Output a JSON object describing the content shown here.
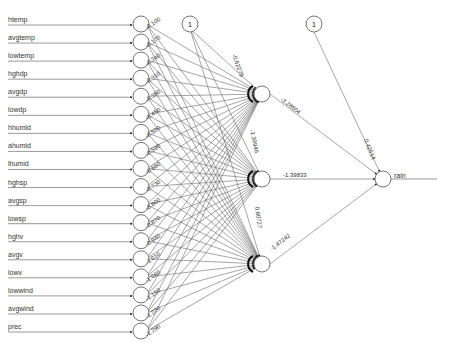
{
  "diagram": {
    "type": "neural-network",
    "inputs": [
      "htemp",
      "avgtemp",
      "lowtemp",
      "hghdp",
      "avgdp",
      "lowdp",
      "hhumid",
      "ahumid",
      "lhumid",
      "hghsp",
      "avgsp",
      "lowsp",
      "hghv",
      "avgv",
      "lowv",
      "lowwind",
      "avgwind",
      "prec"
    ],
    "hidden_count": 3,
    "output": "rain",
    "bias_label": "1",
    "hidden_bias_weight_label": "-0.62279",
    "hidden_weight_labels": [
      "-1.39946",
      "0.60727"
    ],
    "hidden_to_output_weights": [
      "-3.28604",
      "-1.39833",
      "-1.47242"
    ],
    "output_bias_weight": "0.42514",
    "layout": {
      "input_x": 141,
      "input_y0": 24,
      "input_dy": 18.06,
      "node_r": 8,
      "hidden_x": 262,
      "hidden_y": [
        94,
        179,
        264
      ],
      "output_x": 383,
      "output_y": 179,
      "bias1": [
        190,
        24
      ],
      "bias2": [
        314,
        24
      ]
    }
  }
}
